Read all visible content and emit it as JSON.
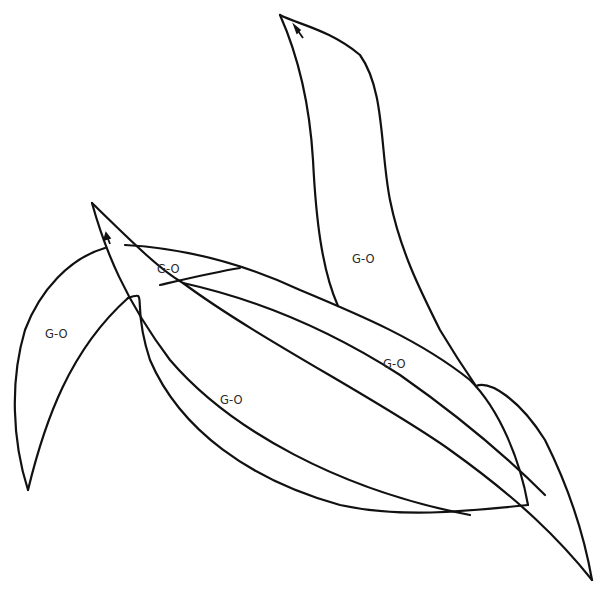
{
  "diagram": {
    "stroke_color": "#111111",
    "background_color": "#ffffff",
    "labels": [
      {
        "id": "top-right-leaf",
        "text": "G-O",
        "x": 364,
        "y": 262
      },
      {
        "id": "upper-band",
        "text": "G-O",
        "x": 169,
        "y": 272
      },
      {
        "id": "left-crescent-leaf",
        "text": "G-O",
        "x": 57,
        "y": 337
      },
      {
        "id": "center-right-band",
        "text": "G-O",
        "x": 395,
        "y": 367
      },
      {
        "id": "center-left-region",
        "text": "G-O",
        "x": 232,
        "y": 403
      }
    ],
    "arrows": [
      {
        "id": "top-right-leaf-arrow",
        "direction": "up-left"
      },
      {
        "id": "thin-leaf-arrow",
        "direction": "up"
      }
    ]
  }
}
